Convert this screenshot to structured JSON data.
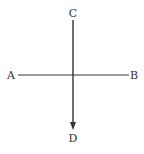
{
  "diagram": {
    "type": "cross-lines-with-arrow",
    "line_color": "#333333",
    "labels": {
      "top": "C",
      "left": "A",
      "right": "B",
      "bottom": "D"
    },
    "horizontal_line": {
      "from": "A",
      "to": "B",
      "arrow": false
    },
    "vertical_line": {
      "from": "C",
      "to": "D",
      "arrow": true,
      "arrow_direction": "down"
    }
  }
}
